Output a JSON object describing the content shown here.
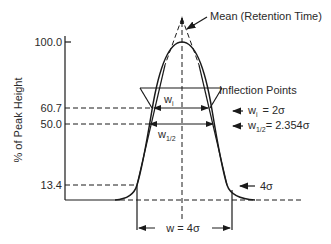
{
  "diagram": {
    "y_axis": {
      "label": "% of Peak Height",
      "ticks": [
        "100.0",
        "60.7",
        "50.0",
        "13.4"
      ]
    },
    "annotations": {
      "mean": "Mean (Retention Time)",
      "inflection": "Inflection Points",
      "wi_label": "w",
      "wi_sub": "i",
      "wi_eq_label": "w",
      "wi_eq_sub": "i",
      "wi_eq_value": "= 2σ",
      "whalf_label": "w",
      "whalf_sub": "1/2",
      "whalf_eq_label": "w",
      "whalf_eq_sub": "1/2",
      "whalf_eq_value": "= 2.354σ",
      "base_4sigma": "4σ",
      "base_width": "w = 4σ"
    },
    "colors": {
      "line": "#1a1a1a",
      "text": "#2a2a2a",
      "background": "#ffffff"
    }
  }
}
